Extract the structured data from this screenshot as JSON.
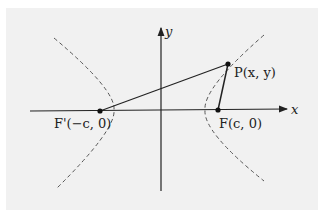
{
  "figure": {
    "axes": {
      "x_label": "x",
      "y_label": "y"
    },
    "points": {
      "p": {
        "label": "P(x, y)"
      },
      "f": {
        "label": "F(c, 0)"
      },
      "f_prime": {
        "label": "F'(−c, 0)"
      }
    },
    "colors": {
      "panel": "#f1f1f1",
      "ink": "#222222",
      "curve": "#555555"
    }
  }
}
